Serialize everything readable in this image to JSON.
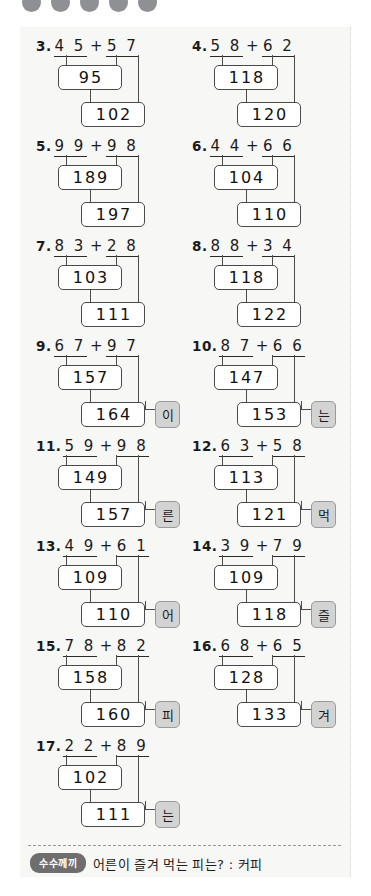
{
  "page": {
    "background_color": "#f7f7f5",
    "top_dots_count": 5,
    "top_dots_color": "#8f9094"
  },
  "problems": [
    {
      "num": "3.",
      "a": "4 5",
      "b": "5 7",
      "step": "95",
      "total": "102",
      "letter": ""
    },
    {
      "num": "4.",
      "a": "5 8",
      "b": "6 2",
      "step": "118",
      "total": "120",
      "letter": ""
    },
    {
      "num": "5.",
      "a": "9 9",
      "b": "9 8",
      "step": "189",
      "total": "197",
      "letter": ""
    },
    {
      "num": "6.",
      "a": "4 4",
      "b": "6 6",
      "step": "104",
      "total": "110",
      "letter": ""
    },
    {
      "num": "7.",
      "a": "8 3",
      "b": "2 8",
      "step": "103",
      "total": "111",
      "letter": ""
    },
    {
      "num": "8.",
      "a": "8 8",
      "b": "3 4",
      "step": "118",
      "total": "122",
      "letter": ""
    },
    {
      "num": "9.",
      "a": "6 7",
      "b": "9 7",
      "step": "157",
      "total": "164",
      "letter": "이"
    },
    {
      "num": "10.",
      "a": "8 7",
      "b": "6 6",
      "step": "147",
      "total": "153",
      "letter": "는"
    },
    {
      "num": "11.",
      "a": "5 9",
      "b": "9 8",
      "step": "149",
      "total": "157",
      "letter": "른"
    },
    {
      "num": "12.",
      "a": "6 3",
      "b": "5 8",
      "step": "113",
      "total": "121",
      "letter": "먹"
    },
    {
      "num": "13.",
      "a": "4 9",
      "b": "6 1",
      "step": "109",
      "total": "110",
      "letter": "어"
    },
    {
      "num": "14.",
      "a": "3 9",
      "b": "7 9",
      "step": "109",
      "total": "118",
      "letter": "즐"
    },
    {
      "num": "15.",
      "a": "7 8",
      "b": "8 2",
      "step": "158",
      "total": "160",
      "letter": "피"
    },
    {
      "num": "16.",
      "a": "6 8",
      "b": "6 5",
      "step": "128",
      "total": "133",
      "letter": "겨"
    },
    {
      "num": "17.",
      "a": "2 2",
      "b": "8 9",
      "step": "102",
      "total": "111",
      "letter": "는"
    }
  ],
  "operator": "+",
  "footer": {
    "badge": "수수께끼",
    "text": "어른이 즐겨 먹는 피는? : 커피"
  }
}
